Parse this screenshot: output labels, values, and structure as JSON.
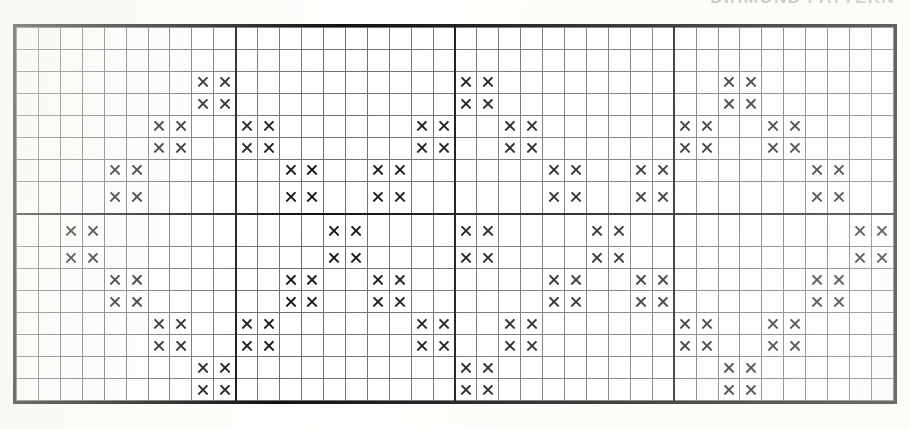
{
  "title": {
    "text": "DIAMOND PATTERN",
    "visible_partial": true
  },
  "chart_data": {
    "type": "table",
    "title": "DIAMOND PATTERN",
    "subtitle": "",
    "xlabel": "",
    "ylabel": "",
    "symbol": "X",
    "symbol_name": "cross-stitch-x",
    "columns": 40,
    "rows": 16,
    "cell_size_px": 22,
    "grid": true,
    "grid_line_color": "#6e6e6e",
    "border_color": "#111111",
    "symbol_color": "#141414",
    "background_color": "#ffffff",
    "section_divider_columns": [
      10,
      20,
      30
    ],
    "section_divider_rows": [
      8
    ],
    "legend": [
      {
        "symbol": "X",
        "label": "stitch"
      }
    ],
    "filled_cells_by_row": [
      [],
      [],
      [
        8,
        9,
        20,
        21,
        32,
        33
      ],
      [
        8,
        9,
        20,
        21,
        32,
        33
      ],
      [
        6,
        7,
        10,
        11,
        18,
        19,
        22,
        23,
        30,
        31,
        34,
        35
      ],
      [
        6,
        7,
        10,
        11,
        18,
        19,
        22,
        23,
        30,
        31,
        34,
        35
      ],
      [
        4,
        5,
        12,
        13,
        16,
        17,
        24,
        25,
        28,
        29,
        36,
        37
      ],
      [
        4,
        5,
        12,
        13,
        16,
        17,
        24,
        25,
        28,
        29,
        36,
        37
      ],
      [
        2,
        3,
        14,
        15,
        20,
        21,
        26,
        27,
        38,
        39
      ],
      [
        2,
        3,
        14,
        15,
        20,
        21,
        26,
        27,
        38,
        39
      ],
      [
        4,
        5,
        12,
        13,
        16,
        17,
        24,
        25,
        28,
        29,
        36,
        37
      ],
      [
        4,
        5,
        12,
        13,
        16,
        17,
        24,
        25,
        28,
        29,
        36,
        37
      ],
      [
        6,
        7,
        10,
        11,
        18,
        19,
        22,
        23,
        30,
        31,
        34,
        35
      ],
      [
        6,
        7,
        10,
        11,
        18,
        19,
        22,
        23,
        30,
        31,
        34,
        35
      ],
      [
        8,
        9,
        20,
        21,
        32,
        33
      ],
      [
        8,
        9,
        20,
        21,
        32,
        33
      ],
      []
    ],
    "row_labels": [],
    "column_labels": []
  }
}
